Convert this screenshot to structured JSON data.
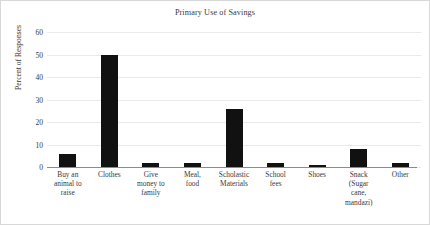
{
  "chart_data": {
    "type": "bar",
    "title": "Primary Use of Savings",
    "xlabel": "",
    "ylabel": "Percent of Responses",
    "categories": [
      "Buy an animal to raise",
      "Clothes",
      "Give money to family",
      "Meal, food",
      "Scholastic Materials",
      "School fees",
      "Shoes",
      "Snack (Sugar cane, mandazi)",
      "Other"
    ],
    "category_lines": [
      [
        "Buy an",
        "animal to",
        "raise"
      ],
      [
        "Clothes"
      ],
      [
        "Give",
        "money to",
        "family"
      ],
      [
        "Meal,",
        "food"
      ],
      [
        "Scholastic",
        "Materials"
      ],
      [
        "School",
        "fees"
      ],
      [
        "Shoes"
      ],
      [
        "Snack",
        "(Sugar",
        "cane,",
        "mandazi)"
      ],
      [
        "Other"
      ]
    ],
    "values": [
      6,
      50,
      2,
      2,
      26,
      2,
      1,
      8,
      2
    ],
    "ylim": [
      0,
      60
    ],
    "yticks": [
      60,
      50,
      40,
      30,
      20,
      10,
      0
    ],
    "ytick_labels": [
      "60",
      "50",
      "40",
      "30",
      "20",
      "10",
      "0"
    ],
    "grid": true,
    "legend": false,
    "bar_color": "#111111",
    "grid_color": "#e9e9e9",
    "axis_color": "#8b8b8b",
    "text_color": "#3a3a3a"
  }
}
